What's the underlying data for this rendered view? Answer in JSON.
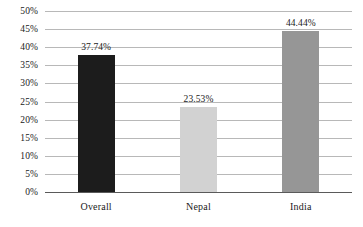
{
  "chart_data": {
    "type": "bar",
    "title": "",
    "subtitle": "",
    "xlabel": "",
    "ylabel": "",
    "categories": [
      "Overall",
      "Nepal",
      "India"
    ],
    "values": [
      37.74,
      23.53,
      44.44
    ],
    "data_labels": [
      "37.74%",
      "23.53%",
      "44.44%"
    ],
    "series": [
      {
        "name": "",
        "values": [
          37.74,
          23.53,
          44.44
        ]
      }
    ],
    "bar_colors": [
      "#1c1c1c",
      "#d2d2d2",
      "#969696"
    ],
    "ylim": [
      0,
      50
    ],
    "ytick_values": [
      0,
      5,
      10,
      15,
      20,
      25,
      30,
      35,
      40,
      45,
      50
    ],
    "ytick_labels": [
      "0%",
      "5%",
      "10%",
      "15%",
      "20%",
      "25%",
      "30%",
      "35%",
      "40%",
      "45%",
      "50%"
    ],
    "grid": true,
    "grid_color": "#b8b8b8",
    "axis_color": "#5a5a5a",
    "legend": false,
    "legend_position": "none",
    "background_color": "#ffffff",
    "text_color": "#1a1a1a"
  }
}
